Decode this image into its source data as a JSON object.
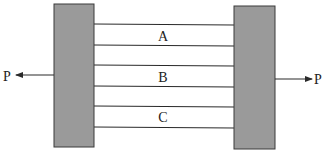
{
  "diagram": {
    "colors": {
      "plate_fill": "#9a9a9a",
      "plate_stroke": "#3a3a3a",
      "line": "#2a2a2a",
      "background": "#ffffff"
    },
    "left_plate": {
      "x": 54,
      "y": 4,
      "width": 40,
      "height": 143
    },
    "right_plate": {
      "x": 234,
      "y": 6,
      "width": 41,
      "height": 143
    },
    "bars": [
      {
        "label": "A",
        "y_top": 24,
        "y_bottom": 45
      },
      {
        "label": "B",
        "y_top": 65,
        "y_bottom": 86
      },
      {
        "label": "C",
        "y_top": 106,
        "y_bottom": 127
      }
    ],
    "forces": {
      "left": {
        "label": "P",
        "direction": "left"
      },
      "right": {
        "label": "P",
        "direction": "right"
      }
    }
  }
}
